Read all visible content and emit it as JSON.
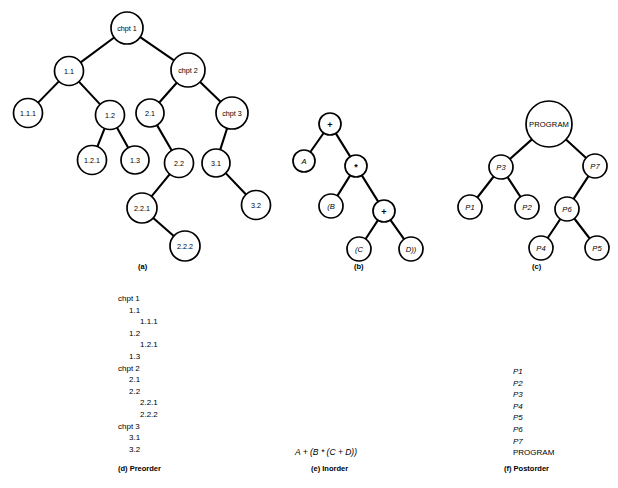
{
  "figure": {
    "stroke_color": "#000000",
    "node_fill": "#ffffff",
    "background": "#ffffff"
  },
  "panels": {
    "a": {
      "caption": "(a)",
      "caption_pos": {
        "x": 138,
        "y": 264
      },
      "nodes": [
        {
          "id": "chpt1",
          "label": "chpt 1",
          "x": 127,
          "y": 28,
          "r": 16,
          "style": "plain"
        },
        {
          "id": "n11",
          "label": "1.1",
          "x": 69,
          "y": 71,
          "r": 14.5,
          "style": "plain"
        },
        {
          "id": "chpt2",
          "label": "chpt 2",
          "x": 188,
          "y": 70,
          "r": 17,
          "style": "plain"
        },
        {
          "id": "n111",
          "label": "1.1.1",
          "x": 28,
          "y": 113,
          "r": 14.5,
          "style": "plain"
        },
        {
          "id": "n12",
          "label": "1.2",
          "x": 110,
          "y": 115,
          "r": 14.5,
          "style": "plain"
        },
        {
          "id": "n21",
          "label": "2.1",
          "x": 150,
          "y": 113,
          "r": 14,
          "style": "plain"
        },
        {
          "id": "chpt3",
          "label": "chpt 3",
          "x": 232,
          "y": 113,
          "r": 16,
          "style": "plain"
        },
        {
          "id": "n121",
          "label": "1.2.1",
          "x": 92,
          "y": 160,
          "r": 14.5,
          "style": "plain"
        },
        {
          "id": "n13",
          "label": "1.3",
          "x": 135,
          "y": 160,
          "r": 14,
          "style": "plain"
        },
        {
          "id": "n22",
          "label": "2.2",
          "x": 179,
          "y": 163,
          "r": 14.5,
          "style": "plain"
        },
        {
          "id": "n31",
          "label": "3.1",
          "x": 216,
          "y": 163,
          "r": 14,
          "style": "plain"
        },
        {
          "id": "n221",
          "label": "2.2.1",
          "x": 142,
          "y": 208,
          "r": 15,
          "style": "plain"
        },
        {
          "id": "n32",
          "label": "3.2",
          "x": 256,
          "y": 205,
          "r": 14.5,
          "style": "plain"
        },
        {
          "id": "n222",
          "label": "2.2.2",
          "x": 185,
          "y": 246,
          "r": 15,
          "style": "plain"
        }
      ],
      "edges": [
        [
          "chpt1",
          "n11"
        ],
        [
          "chpt1",
          "chpt2"
        ],
        [
          "n11",
          "n111"
        ],
        [
          "n11",
          "n12"
        ],
        [
          "chpt2",
          "n21"
        ],
        [
          "chpt2",
          "chpt3"
        ],
        [
          "n12",
          "n121"
        ],
        [
          "n12",
          "n13"
        ],
        [
          "n21",
          "n22"
        ],
        [
          "chpt3",
          "n31"
        ],
        [
          "n22",
          "n221"
        ],
        [
          "n31",
          "n32"
        ],
        [
          "n221",
          "n222"
        ]
      ]
    },
    "b": {
      "caption": "(b)",
      "caption_pos": {
        "x": 354,
        "y": 264
      },
      "nodes": [
        {
          "id": "plus1",
          "label": "+",
          "x": 330,
          "y": 124,
          "r": 11,
          "style": "op"
        },
        {
          "id": "A",
          "label": "A",
          "x": 304,
          "y": 161,
          "r": 11,
          "style": "ital"
        },
        {
          "id": "star",
          "label": "*",
          "x": 356,
          "y": 166,
          "r": 11,
          "style": "op"
        },
        {
          "id": "B",
          "label": "(B",
          "x": 331,
          "y": 206,
          "r": 12,
          "style": "ital"
        },
        {
          "id": "plus2",
          "label": "+",
          "x": 384,
          "y": 211,
          "r": 11,
          "style": "op"
        },
        {
          "id": "C",
          "label": "(C",
          "x": 359,
          "y": 249,
          "r": 12,
          "style": "ital"
        },
        {
          "id": "D",
          "label": "D))",
          "x": 411,
          "y": 249,
          "r": 12,
          "style": "ital"
        }
      ],
      "edges": [
        [
          "plus1",
          "A"
        ],
        [
          "plus1",
          "star"
        ],
        [
          "star",
          "B"
        ],
        [
          "star",
          "plus2"
        ],
        [
          "plus2",
          "C"
        ],
        [
          "plus2",
          "D"
        ]
      ]
    },
    "c": {
      "caption": "(c)",
      "caption_pos": {
        "x": 532,
        "y": 264
      },
      "nodes": [
        {
          "id": "PROGRAM",
          "label": "PROGRAM",
          "x": 549,
          "y": 124,
          "r": 23,
          "style": "prog"
        },
        {
          "id": "P3",
          "label": "P3",
          "x": 501,
          "y": 167,
          "r": 12,
          "style": "ital"
        },
        {
          "id": "P7",
          "label": "P7",
          "x": 595,
          "y": 166,
          "r": 12,
          "style": "ital"
        },
        {
          "id": "P1",
          "label": "P1",
          "x": 470,
          "y": 207,
          "r": 12,
          "style": "ital"
        },
        {
          "id": "P2",
          "label": "P2",
          "x": 527,
          "y": 207,
          "r": 12,
          "style": "ital"
        },
        {
          "id": "P6",
          "label": "P6",
          "x": 567,
          "y": 209,
          "r": 12,
          "style": "ital"
        },
        {
          "id": "P4",
          "label": "P4",
          "x": 541,
          "y": 248,
          "r": 12,
          "style": "ital"
        },
        {
          "id": "P5",
          "label": "P5",
          "x": 597,
          "y": 248,
          "r": 12,
          "style": "ital"
        }
      ],
      "edges": [
        [
          "PROGRAM",
          "P3"
        ],
        [
          "PROGRAM",
          "P7"
        ],
        [
          "P3",
          "P1"
        ],
        [
          "P3",
          "P2"
        ],
        [
          "P7",
          "P6"
        ],
        [
          "P6",
          "P4"
        ],
        [
          "P6",
          "P5"
        ]
      ]
    },
    "d": {
      "caption": "(d) Preorder",
      "items": [
        {
          "text": "chpt 1",
          "indent": 0
        },
        {
          "text": "1.1",
          "indent": 1
        },
        {
          "text": "1.1.1",
          "indent": 2
        },
        {
          "text": "1.2",
          "indent": 1
        },
        {
          "text": "1.2.1",
          "indent": 2
        },
        {
          "text": "1.3",
          "indent": 1
        },
        {
          "text": "chpt 2",
          "indent": 0
        },
        {
          "text": "2.1",
          "indent": 1
        },
        {
          "text": "2.2",
          "indent": 1
        },
        {
          "text": "2.2.1",
          "indent": 2
        },
        {
          "text": "2.2.2",
          "indent": 2
        },
        {
          "text": "chpt 3",
          "indent": 0
        },
        {
          "text": "3.1",
          "indent": 1
        },
        {
          "text": "3.2",
          "indent": 1
        }
      ]
    },
    "e": {
      "caption": "(e) Inorder",
      "expression": "A + (B * (C + D))"
    },
    "f": {
      "caption": "(f) Postorder",
      "items": [
        {
          "text": "P1",
          "italic": true
        },
        {
          "text": "P2",
          "italic": true
        },
        {
          "text": "P3",
          "italic": true
        },
        {
          "text": "P4",
          "italic": true
        },
        {
          "text": "P5",
          "italic": true
        },
        {
          "text": "P6",
          "italic": true
        },
        {
          "text": "P7",
          "italic": true
        },
        {
          "text": "PROGRAM",
          "italic": false
        }
      ]
    }
  }
}
